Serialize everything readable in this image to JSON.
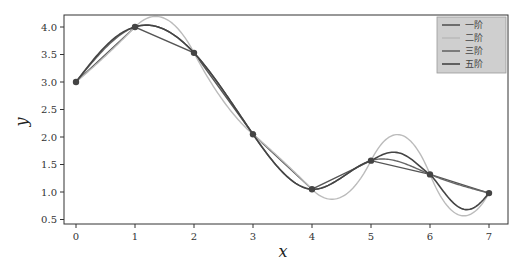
{
  "chart_data": {
    "type": "line",
    "title": "",
    "xlabel": "x",
    "ylabel": "y",
    "xlim": [
      -0.35,
      7.3
    ],
    "ylim": [
      0.38,
      4.2
    ],
    "xticks": [
      0,
      1,
      2,
      3,
      4,
      5,
      6,
      7
    ],
    "yticks": [
      0.5,
      1.0,
      1.5,
      2.0,
      2.5,
      3.0,
      3.5,
      4.0
    ],
    "ytick_labels": [
      "0.5",
      "1.0",
      "1.5",
      "2.0",
      "2.5",
      "3.0",
      "3.5",
      "4.0"
    ],
    "grid": false,
    "legend_position": "upper right",
    "points": {
      "x": [
        0,
        1,
        2,
        3,
        4,
        5,
        6,
        7
      ],
      "y": [
        3.0,
        4.0,
        3.53,
        2.05,
        1.05,
        1.57,
        1.32,
        0.98
      ]
    },
    "series": [
      {
        "name": "一阶",
        "kind": "linear",
        "color": "#555555",
        "width": 1.4
      },
      {
        "name": "二阶",
        "kind": "quadratic",
        "color": "#bbbbbb",
        "width": 1.4
      },
      {
        "name": "三阶",
        "kind": "cubic",
        "color": "#666666",
        "width": 1.4
      },
      {
        "name": "五阶",
        "kind": "quintic",
        "color": "#444444",
        "width": 1.6
      }
    ],
    "legend": [
      "一阶",
      "二阶",
      "三阶",
      "五阶"
    ]
  }
}
